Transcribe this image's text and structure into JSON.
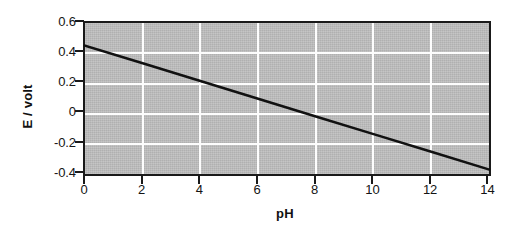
{
  "chart_data": {
    "type": "line",
    "title": "",
    "xlabel": "pH",
    "ylabel": "E / volt",
    "xlim": [
      0,
      14
    ],
    "ylim": [
      -0.4,
      0.6
    ],
    "xticks": [
      0,
      2,
      4,
      6,
      8,
      10,
      12,
      14
    ],
    "xtick_labels": [
      "0",
      "2",
      "4",
      "6",
      "8",
      "10",
      "12",
      "14"
    ],
    "yticks": [
      0.6,
      0.4,
      0.2,
      0,
      -0.2,
      -0.4
    ],
    "ytick_labels": [
      "0.6",
      "0.4",
      "0.2",
      "0",
      "-0.2",
      "-0.4"
    ],
    "grid": true,
    "grid_color": "#fdfdfd",
    "grid_x_at": [
      2,
      4,
      6,
      8,
      10,
      12
    ],
    "grid_y_at": [
      0.4,
      0.2,
      0,
      -0.2
    ],
    "plot_background": "#bfbfbf",
    "line_color": "#111111",
    "line_width": 2.5,
    "series": [
      {
        "name": "E vs pH",
        "x": [
          0,
          2,
          4,
          6,
          8,
          10,
          12,
          14
        ],
        "values": [
          0.45,
          0.333,
          0.216,
          0.098,
          -0.019,
          -0.136,
          -0.253,
          -0.37
        ]
      }
    ],
    "slope": -0.0586,
    "intercept": 0.45
  }
}
